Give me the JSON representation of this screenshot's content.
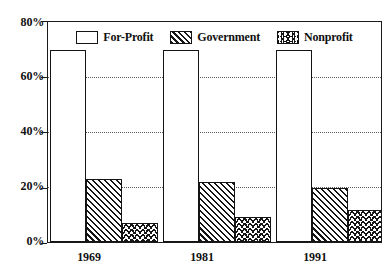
{
  "chart_data": {
    "type": "bar",
    "title": "",
    "subtitle": "",
    "xlabel": "",
    "ylabel": "",
    "categories": [
      "1969",
      "1981",
      "1991"
    ],
    "series": [
      {
        "name": "For-Profit",
        "pattern": "solid-white",
        "values": [
          70,
          70,
          70
        ]
      },
      {
        "name": "Government",
        "pattern": "diagonal-hatch",
        "values": [
          23,
          22,
          19.5
        ]
      },
      {
        "name": "Nonprofit",
        "pattern": "vertical-zigzag",
        "values": [
          7,
          9,
          11.5
        ]
      }
    ],
    "ylim": [
      0,
      80
    ],
    "yticks": [
      0,
      20,
      40,
      60,
      80
    ],
    "ytick_labels": [
      "0%",
      "20%",
      "40%",
      "60%",
      "80%"
    ],
    "grid": true,
    "grid_axis": "y",
    "grid_style": "dotted",
    "legend_position": "top-inside",
    "colors": {
      "ink": "#141414",
      "gridline": "#5b5b5b",
      "background": "#ffffff"
    }
  },
  "legend": {
    "items": [
      {
        "label": "For-Profit"
      },
      {
        "label": "Government"
      },
      {
        "label": "Nonprofit"
      }
    ]
  }
}
